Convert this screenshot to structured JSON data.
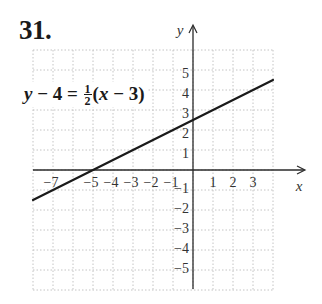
{
  "problem": {
    "number": "31."
  },
  "equation": {
    "lhs_var": "y",
    "lhs_rest": " − 4 = ",
    "frac_num": "1",
    "frac_den": "2",
    "rhs_open": "(",
    "rhs_var": "x",
    "rhs_rest": " − 3)"
  },
  "axes": {
    "x_label": "x",
    "y_label": "y",
    "x_ticks": [
      {
        "label": "−7",
        "value": -7
      },
      {
        "label": "−5",
        "value": -5
      },
      {
        "label": "−4",
        "value": -4
      },
      {
        "label": "−3",
        "value": -3
      },
      {
        "label": "−2",
        "value": -2
      },
      {
        "label": "−1",
        "value": -1
      },
      {
        "label": "1",
        "value": 1
      },
      {
        "label": "2",
        "value": 2
      },
      {
        "label": "3",
        "value": 3
      }
    ],
    "y_ticks": [
      {
        "label": "5",
        "value": 5
      },
      {
        "label": "4",
        "value": 4
      },
      {
        "label": "3",
        "value": 3
      },
      {
        "label": "2",
        "value": 2
      },
      {
        "label": "1",
        "value": 1
      },
      {
        "label": "−1",
        "value": -1
      },
      {
        "label": "−2",
        "value": -2
      },
      {
        "label": "−3",
        "value": -3
      },
      {
        "label": "−4",
        "value": -4
      },
      {
        "label": "−5",
        "value": -5
      }
    ]
  },
  "colors": {
    "line": "#1a1a1a",
    "grid": "#c4c4c4",
    "axis": "#2a2a2a"
  },
  "chart_data": {
    "type": "line",
    "title": "31.",
    "annotation": "y − 4 = 1/2(x − 3)",
    "xlabel": "x",
    "ylabel": "y",
    "xlim": [
      -8,
      4
    ],
    "ylim": [
      -6,
      6
    ],
    "grid": true,
    "grid_style": "dotted",
    "x_tick_labels": [
      "−7",
      "−5",
      "−4",
      "−3",
      "−2",
      "−1",
      "1",
      "2",
      "3"
    ],
    "y_tick_labels": [
      "5",
      "4",
      "3",
      "2",
      "1",
      "−1",
      "−2",
      "−3",
      "−4",
      "−5"
    ],
    "series": [
      {
        "name": "y − 4 = 1/2(x − 3)",
        "slope": 0.5,
        "y_intercept": 2.5,
        "x_intercept": -5,
        "x": [
          -8,
          -5,
          0,
          3,
          4
        ],
        "y": [
          -1.5,
          0,
          2.5,
          4,
          4.5
        ]
      }
    ]
  }
}
